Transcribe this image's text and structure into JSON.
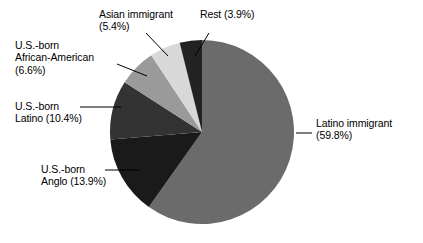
{
  "chart_data": {
    "type": "pie",
    "title": "",
    "xlabel": "",
    "ylabel": "",
    "legend_position": "none",
    "grid": false,
    "label_format": "{name} ({value}%)",
    "start_angle_deg": 0,
    "direction": "clockwise",
    "categories": [
      "Latino immigrant",
      "U.S.-born Anglo",
      "U.S.-born Latino",
      "U.S.-born African-American",
      "Asian immigrant",
      "Rest"
    ],
    "values": [
      59.8,
      13.9,
      10.4,
      6.6,
      5.4,
      3.9
    ],
    "colors": [
      "#6b6b6b",
      "#1a1a1a",
      "#333333",
      "#9a9a9a",
      "#d8d8d8",
      "#222222"
    ],
    "slices": [
      {
        "name": "Latino immigrant",
        "value": 59.8,
        "color": "#6b6b6b",
        "label_name": "Latino immigrant",
        "label_value": "(59.8%)"
      },
      {
        "name": "U.S.-born Anglo",
        "value": 13.9,
        "color": "#1a1a1a",
        "label_name": "U.S.-born",
        "label_value": "Anglo (13.9%)"
      },
      {
        "name": "U.S.-born Latino",
        "value": 10.4,
        "color": "#333333",
        "label_name": "U.S.-born",
        "label_value": "Latino (10.4%)"
      },
      {
        "name": "U.S.-born African-American",
        "value": 6.6,
        "color": "#9a9a9a",
        "label_line1": "U.S.-born",
        "label_line2": "African-American",
        "label_line3": "(6.6%)"
      },
      {
        "name": "Asian immigrant",
        "value": 5.4,
        "color": "#d8d8d8",
        "label_name": "Asian immigrant",
        "label_value": "(5.4%)"
      },
      {
        "name": "Rest",
        "value": 3.9,
        "color": "#222222",
        "label_name": "Rest (3.9%)",
        "label_value": ""
      }
    ]
  },
  "labels": {
    "asian_line1": "Asian immigrant",
    "asian_line2": "(5.4%)",
    "rest_line1": "Rest (3.9%)",
    "africanam_line1": "U.S.-born",
    "africanam_line2": "African-American",
    "africanam_line3": "(6.6%)",
    "uslatino_line1": "U.S.-born",
    "uslatino_line2": "Latino (10.4%)",
    "anglo_line1": "U.S.-born",
    "anglo_line2": "Anglo (13.9%)",
    "latinoimm_line1": "Latino immigrant",
    "latinoimm_line2": "(59.8%)"
  },
  "style": {
    "background": "#ffffff",
    "text_color": "#000000",
    "leader_color": "#000000"
  }
}
